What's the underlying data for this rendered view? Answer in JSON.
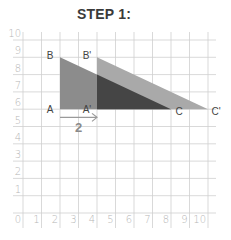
{
  "title": "STEP 1:",
  "chart_data": {
    "type": "diagram",
    "title": "STEP 1:",
    "x_range": [
      0,
      10
    ],
    "y_range": [
      0,
      10
    ],
    "x_ticks": [
      "0",
      "1",
      "2",
      "3",
      "4",
      "5",
      "6",
      "7",
      "8",
      "9",
      "10"
    ],
    "y_ticks": [
      "0",
      "1",
      "2",
      "3",
      "4",
      "5",
      "6",
      "7",
      "8",
      "9",
      "10"
    ],
    "grid": true,
    "shapes": [
      {
        "name": "triangle-ABC",
        "fill": "#8c8c8c",
        "points": [
          [
            2,
            6
          ],
          [
            2,
            9
          ],
          [
            8,
            6
          ]
        ],
        "labels": [
          "A",
          "B",
          "C"
        ]
      },
      {
        "name": "triangle-ABC-prime",
        "fill": "#a9a9a9",
        "points": [
          [
            4,
            6
          ],
          [
            4,
            9
          ],
          [
            10,
            6
          ]
        ],
        "labels": [
          "A'",
          "B'",
          "C'"
        ]
      }
    ],
    "overlap_fill": "#454545",
    "translation": {
      "from": [
        2,
        5.5
      ],
      "to": [
        4,
        5.5
      ],
      "label": "2",
      "color": "#9a9a9a"
    }
  }
}
